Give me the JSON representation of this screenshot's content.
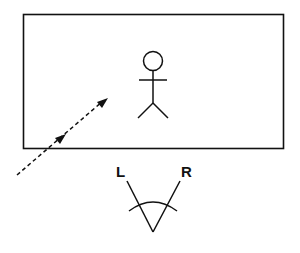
{
  "diagram": {
    "frame": {
      "label": ""
    },
    "figure": {
      "name": "stick-figure"
    },
    "viewer": {
      "left_label": "L",
      "right_label": "R"
    },
    "arrow": {
      "style": "dashed",
      "direction": "toward-figure"
    }
  },
  "colors": {
    "stroke": "#111111",
    "background": "#ffffff"
  }
}
